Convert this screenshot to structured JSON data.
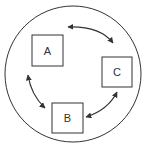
{
  "diagram": {
    "type": "cycle",
    "nodes": [
      {
        "id": "A",
        "label": "A"
      },
      {
        "id": "B",
        "label": "B"
      },
      {
        "id": "C",
        "label": "C"
      }
    ],
    "edges": [
      {
        "from": "A",
        "to": "C",
        "bidirectional": true
      },
      {
        "from": "C",
        "to": "B",
        "bidirectional": true
      },
      {
        "from": "B",
        "to": "A",
        "bidirectional": true
      }
    ],
    "colors": {
      "stroke": "#333333",
      "background": "#ffffff"
    }
  }
}
